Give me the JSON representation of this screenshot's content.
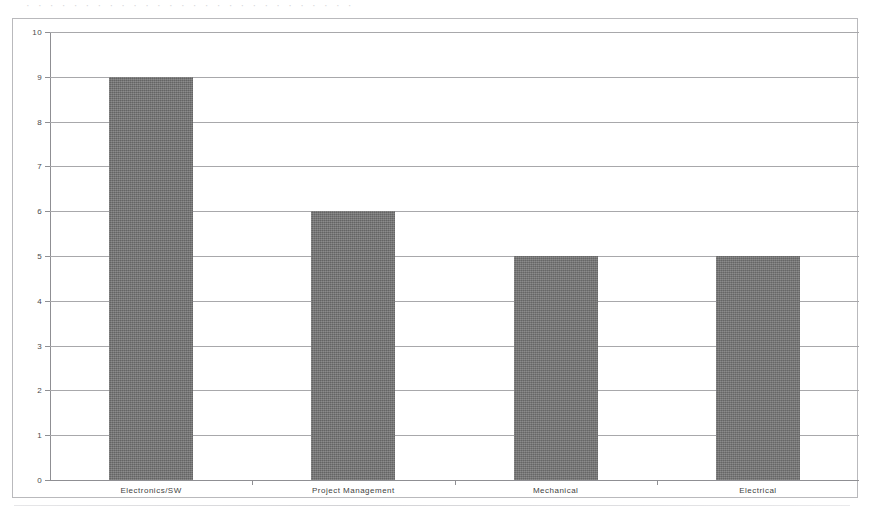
{
  "chart_data": {
    "type": "bar",
    "title": "",
    "subtitle": "",
    "xlabel": "",
    "ylabel": "",
    "categories": [
      "Electronics/SW",
      "Project Management",
      "Mechanical",
      "Electrical"
    ],
    "values": [
      9,
      6,
      5,
      5
    ],
    "series": [
      {
        "name": "Count",
        "values": [
          9,
          6,
          5,
          5
        ]
      }
    ],
    "ylim": [
      0,
      10
    ],
    "ytick_step": 1,
    "ytick_labels": [
      "0",
      "1",
      "2",
      "3",
      "4",
      "5",
      "6",
      "7",
      "8",
      "9",
      "10"
    ],
    "grid": "horizontal",
    "legend": "none",
    "bar_color": "#737373",
    "gridline_color": "#a8a8ab",
    "axis_color": "#8f8f93",
    "frame_color": "#b9b9bc",
    "text_color": "#3f3f41",
    "annotations": []
  },
  "artifacts": {
    "top_clipped_text": "· · · · · · · · · · · · · · · · · · · · · · · · · · · ·"
  }
}
